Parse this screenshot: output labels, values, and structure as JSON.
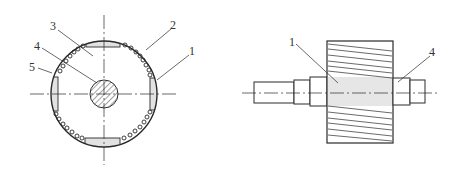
{
  "figure": {
    "left_view": {
      "title": "rotor cross-section",
      "labels": [
        {
          "id": "3",
          "text": "3"
        },
        {
          "id": "4",
          "text": "4"
        },
        {
          "id": "5",
          "text": "5"
        },
        {
          "id": "2",
          "text": "2"
        },
        {
          "id": "1",
          "text": "1"
        }
      ]
    },
    "right_view": {
      "title": "rotor side view",
      "labels": [
        {
          "id": "1",
          "text": "1"
        },
        {
          "id": "4",
          "text": "4"
        }
      ]
    },
    "colors": {
      "line": "#2a2a2a",
      "magnet_fill": "#e2e2e2",
      "core_band_fill": "#e6e6e6",
      "background": "#ffffff"
    }
  }
}
